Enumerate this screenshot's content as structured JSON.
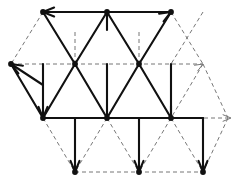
{
  "figure": {
    "kind": "lattice-diagram",
    "width": 240,
    "height": 185,
    "background_color": "#ffffff",
    "solid_color": "#111111",
    "dashed_color": "#777777",
    "solid_stroke_width": 2.1,
    "dashed_stroke_width": 1,
    "dash_pattern": "4 3",
    "geometry": {
      "unit_x": 32,
      "unit_y": 18.5,
      "origin_x": 11,
      "origin_y": 12
    },
    "vertices": [
      {
        "id": "A1",
        "x": 43,
        "y": 12,
        "marked": true
      },
      {
        "id": "A2",
        "x": 107,
        "y": 12,
        "marked": true
      },
      {
        "id": "A3",
        "x": 171,
        "y": 12,
        "marked": true
      },
      {
        "id": "B0",
        "x": 11,
        "y": 64,
        "marked": true
      },
      {
        "id": "B1",
        "x": 75,
        "y": 64,
        "marked": true
      },
      {
        "id": "B2",
        "x": 139,
        "y": 64,
        "marked": true
      },
      {
        "id": "B3",
        "x": 203,
        "y": 64,
        "marked": false
      },
      {
        "id": "C0",
        "x": 43,
        "y": 118,
        "marked": true
      },
      {
        "id": "C1",
        "x": 107,
        "y": 118,
        "marked": true
      },
      {
        "id": "C2",
        "x": 171,
        "y": 118,
        "marked": true
      },
      {
        "id": "D1",
        "x": 75,
        "y": 172,
        "marked": true
      },
      {
        "id": "D2",
        "x": 139,
        "y": 172,
        "marked": true
      },
      {
        "id": "D3",
        "x": 203,
        "y": 172,
        "marked": true
      }
    ],
    "honeycomb_edges": [
      {
        "from": "A1",
        "to": "A2",
        "arrow": "from",
        "note": "top horizontal left, arrow at A1"
      },
      {
        "from": "A3",
        "to": "A2",
        "arrow": "from",
        "note": "top horizontal right, arrow at A3"
      },
      {
        "from": "A1",
        "to": "B1",
        "arrow": "none"
      },
      {
        "from": "A2",
        "to": "B1",
        "arrow": "none"
      },
      {
        "from": "A2",
        "to": "B2",
        "arrow": "none"
      },
      {
        "from": "A3",
        "to": "B2",
        "arrow": "none"
      },
      {
        "from": "B1",
        "to": "C0",
        "arrow": "none"
      },
      {
        "from": "B0",
        "to": "C0",
        "arrow": "to-b0"
      },
      {
        "from": "B1",
        "to": "C1",
        "arrow": "none"
      },
      {
        "from": "B2",
        "to": "C1",
        "arrow": "none"
      },
      {
        "from": "B2",
        "to": "C2",
        "arrow": "none"
      },
      {
        "from": "C0",
        "to": "C0v",
        "arrow": "none",
        "note": "vertical drop"
      },
      {
        "from": "C1",
        "to": "D1",
        "arrow": "to"
      },
      {
        "from": "C1",
        "to": "D2",
        "arrow": "to"
      },
      {
        "from": "C2",
        "to": "D3",
        "arrow": "to"
      },
      {
        "from": "C0",
        "to": "C1",
        "arrow": "none"
      },
      {
        "from": "C1",
        "to": "C2",
        "arrow": "none"
      }
    ],
    "arrowheads": [
      {
        "id": "ah-top-left",
        "x": 43,
        "y": 12,
        "angle": 180,
        "style": "solid"
      },
      {
        "id": "ah-top-right",
        "x": 171,
        "y": 12,
        "angle": -30,
        "style": "solid"
      },
      {
        "id": "ah-left-mid",
        "x": 11,
        "y": 64,
        "angle": 210,
        "style": "solid"
      },
      {
        "id": "ah-right-upper",
        "x": 203,
        "y": 64,
        "angle": -30,
        "style": "dashed"
      },
      {
        "id": "ah-left-low",
        "x": 43,
        "y": 118,
        "angle": 90,
        "style": "solid"
      },
      {
        "id": "ah-right-low",
        "x": 231,
        "y": 118,
        "angle": 0,
        "style": "dashed"
      },
      {
        "id": "ah-bottom-1",
        "x": 75,
        "y": 172,
        "angle": 90,
        "style": "solid"
      },
      {
        "id": "ah-bottom-2",
        "x": 139,
        "y": 172,
        "angle": 90,
        "style": "solid"
      },
      {
        "id": "ah-bottom-3",
        "x": 203,
        "y": 172,
        "angle": 90,
        "style": "solid"
      }
    ],
    "legend": [],
    "labels": []
  }
}
